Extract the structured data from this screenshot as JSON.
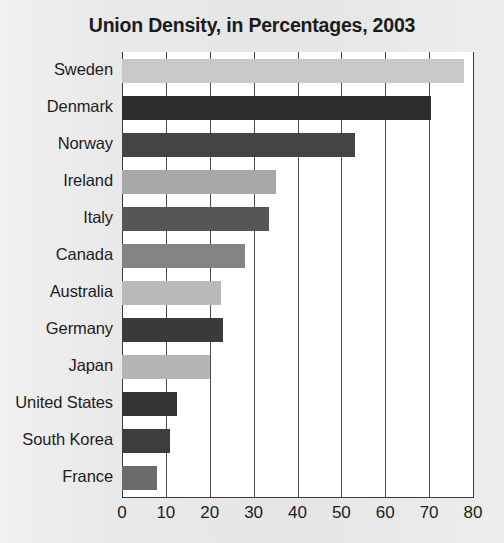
{
  "chart_data": {
    "type": "bar",
    "orientation": "horizontal",
    "title": "Union Density, in Percentages, 2003",
    "xlabel": "",
    "ylabel": "",
    "xlim": [
      0,
      80
    ],
    "xticks": [
      0,
      10,
      20,
      30,
      40,
      50,
      60,
      70,
      80
    ],
    "grid": true,
    "legend": "none",
    "categories": [
      "Sweden",
      "Denmark",
      "Norway",
      "Ireland",
      "Italy",
      "Canada",
      "Australia",
      "Germany",
      "Japan",
      "United States",
      "South Korea",
      "France"
    ],
    "values": [
      78,
      70.5,
      53,
      35,
      33.5,
      28,
      22.5,
      23,
      20,
      12.5,
      11,
      8
    ],
    "bar_colors": [
      "#c9c9c9",
      "#2e2e2e",
      "#444444",
      "#a8a8a8",
      "#565656",
      "#848484",
      "#b9b9b9",
      "#3a3a3a",
      "#b5b5b5",
      "#333333",
      "#3d3d3d",
      "#6b6b6b"
    ]
  },
  "style": {
    "page_background": "#e9e9e9",
    "plot_background": "#ffffff",
    "axis_color": "#3a3a3a",
    "text_color": "#1d1d1d"
  }
}
